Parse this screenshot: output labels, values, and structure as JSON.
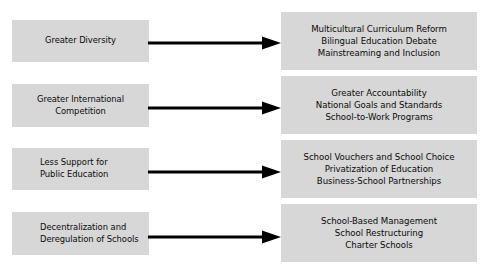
{
  "diagram": {
    "type": "two-column-flow",
    "colors": {
      "box_fill": "#d7d7d7",
      "text": "#0a0a0a",
      "arrow": "#000000",
      "background": "#ffffff"
    },
    "rows": [
      {
        "cause": {
          "lines": [
            "Greater Diversity"
          ],
          "align": "center"
        },
        "arrow": {
          "direction": "right",
          "label": ""
        },
        "effect": {
          "lines": [
            "Multicultural Curriculum Reform",
            "Bilingual Education Debate",
            "Mainstreaming and Inclusion"
          ],
          "align": "center"
        }
      },
      {
        "cause": {
          "lines": [
            "Greater International",
            "Competition"
          ],
          "align": "center"
        },
        "arrow": {
          "direction": "right",
          "label": ""
        },
        "effect": {
          "lines": [
            "Greater Accountability",
            "National Goals and Standards",
            "School-to-Work Programs"
          ],
          "align": "center"
        }
      },
      {
        "cause": {
          "lines": [
            "Less Support for",
            "Public Education"
          ],
          "align": "left"
        },
        "arrow": {
          "direction": "right",
          "label": ""
        },
        "effect": {
          "lines": [
            "School Vouchers and School Choice",
            "Privatization of Education",
            "Business-School Partnerships"
          ],
          "align": "center"
        }
      },
      {
        "cause": {
          "lines": [
            "Decentralization and",
            "Deregulation of Schools"
          ],
          "align": "left"
        },
        "arrow": {
          "direction": "right",
          "label": ""
        },
        "effect": {
          "lines": [
            "School-Based Management",
            "School Restructuring",
            "Charter Schools"
          ],
          "align": "center"
        }
      }
    ]
  }
}
